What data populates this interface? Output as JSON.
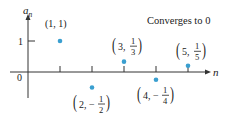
{
  "chart_data": {
    "type": "scatter",
    "title": "",
    "annotation": "Converges to 0",
    "xlabel": "n",
    "ylabel": "a_n",
    "origin_label": "0",
    "y_tick_labels": [
      "1"
    ],
    "x_ticks": [
      1,
      2,
      3,
      4,
      5
    ],
    "grid": false,
    "series": [
      {
        "name": "a_n",
        "points": [
          {
            "n": 1,
            "a": 1,
            "label_n": "1",
            "label_a": "1",
            "fraction": false
          },
          {
            "n": 2,
            "a": -0.5,
            "label_n": "2",
            "num": "1",
            "den": "2",
            "sign": "−",
            "fraction": true
          },
          {
            "n": 3,
            "a": 0.3333,
            "label_n": "3",
            "num": "1",
            "den": "3",
            "sign": "",
            "fraction": true
          },
          {
            "n": 4,
            "a": -0.25,
            "label_n": "4",
            "num": "1",
            "den": "4",
            "sign": "−",
            "fraction": true
          },
          {
            "n": 5,
            "a": 0.2,
            "label_n": "5",
            "num": "1",
            "den": "5",
            "sign": "",
            "fraction": true
          }
        ]
      }
    ],
    "xlim": [
      0,
      5.6
    ],
    "ylim": [
      -0.9,
      1.6
    ],
    "colors": {
      "point": "#3a9fd0",
      "axis": "#333333"
    }
  }
}
